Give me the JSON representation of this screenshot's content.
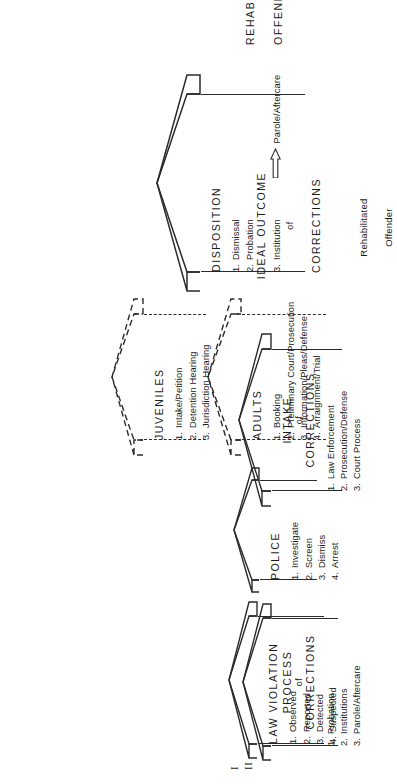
{
  "figure": {
    "rows": [
      {
        "numeral": "I"
      },
      {
        "numeral": "II"
      }
    ]
  },
  "row1": {
    "law_violation": {
      "title": "LAW VIOLATION",
      "items": [
        "Observed",
        "Reported",
        "Detected",
        "Suspected"
      ],
      "numbers": [
        "1.",
        "2.",
        "3.",
        "4."
      ]
    },
    "police": {
      "title": "POLICE",
      "items": [
        "Investigate",
        "Screen",
        "Dismiss",
        "Arrest"
      ],
      "numbers": [
        "1.",
        "2.",
        "3.",
        "4."
      ]
    },
    "adults": {
      "title": "ADULTS",
      "items": [
        "Booking",
        "Preliminary Court/Prosecution",
        "Information/Pleas/Defense",
        "Arraignment/Trial"
      ],
      "numbers": [
        "1.",
        "2.",
        "3.",
        "4."
      ]
    },
    "juveniles": {
      "title": "JUVENILES",
      "items": [
        "Intake/Petition",
        "Detention Hearing",
        "Jurisdiction Hearing"
      ],
      "numbers": [
        "1.",
        "2.",
        "3."
      ]
    },
    "disposition": {
      "title": "DISPOSITION",
      "items": [
        "Dismissal",
        "Probation",
        "Institution"
      ],
      "numbers": [
        "1.",
        "2.",
        "3."
      ],
      "branch_label": "Parole/Aftercare"
    },
    "outcome": {
      "line1": "REHABILITATED",
      "line2": "OFFENDER"
    }
  },
  "row2": {
    "process": {
      "title": "PROCESS",
      "of": "of",
      "subtitle": "CORRECTIONS",
      "items": [
        "Probation",
        "Institutions",
        "Parole/Aftercare"
      ],
      "numbers": [
        "1.",
        "2.",
        "3."
      ]
    },
    "intake": {
      "title": "INTAKE",
      "of": "of",
      "subtitle": "CORRECTIONS",
      "items": [
        "Law Enforcement",
        "Prosecution/Defense",
        "Court Process"
      ],
      "numbers": [
        "1.",
        "2.",
        "3."
      ]
    },
    "ideal": {
      "title": "IDEAL OUTCOME",
      "of": "of",
      "subtitle": "CORRECTIONS",
      "detail_line1": "Rehabilitated",
      "detail_line2": "Offender"
    }
  },
  "colors": {
    "ink": "#2b2b2b",
    "background": "#ffffff"
  }
}
